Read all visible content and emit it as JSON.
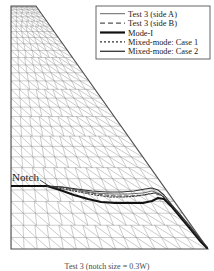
{
  "figure": {
    "name": "fem-mesh-crack-trajectory",
    "caption": "Test 3 (notch size = 0.3W)",
    "notch_label": "Notch"
  },
  "legend": {
    "box": {
      "x": 96,
      "y": 6,
      "width": 114,
      "height": 53,
      "border_color": "#555555",
      "fill": "#ffffff"
    },
    "entries": [
      {
        "label": "Test 3 (side A)",
        "style": "thin-solid",
        "color": "#555555",
        "width": 0.9,
        "dash": ""
      },
      {
        "label": "Test 3 (side B)",
        "style": "dashed",
        "color": "#555555",
        "width": 1.1,
        "dash": "5,3"
      },
      {
        "label": "Mode-I",
        "style": "thick-solid",
        "color": "#111111",
        "width": 2.2,
        "dash": ""
      },
      {
        "label": "Mixed-mode: Case 1",
        "style": "dotted",
        "color": "#333333",
        "width": 1.1,
        "dash": "2,2"
      },
      {
        "label": "Mixed-mode: Case 2",
        "style": "solid",
        "color": "#333333",
        "width": 1.3,
        "dash": ""
      }
    ]
  },
  "mesh": {
    "outline_color": "#4f4f4f",
    "line_color": "#8d8d8d",
    "left": 11,
    "top": 6,
    "right": 208,
    "bottom": 250,
    "apex_x": 36,
    "description": "triangular finite element mesh, wedge shaped domain"
  },
  "chart_data": {
    "type": "line",
    "title": "Test 3 (notch size = 0.3W)",
    "xlabel": "",
    "ylabel": "",
    "grid": false,
    "legend_position": "top-right",
    "notch_line": {
      "name": "Notch",
      "points": [
        [
          11,
          186
        ],
        [
          47,
          186
        ]
      ]
    },
    "series": [
      {
        "name": "Test 3 (side A)",
        "style": "thin-solid",
        "color": "#555555",
        "points": [
          [
            47,
            186
          ],
          [
            62,
            187
          ],
          [
            78,
            190
          ],
          [
            95,
            193
          ],
          [
            112,
            194
          ],
          [
            128,
            194
          ],
          [
            143,
            193
          ],
          [
            152,
            191
          ],
          [
            160,
            194
          ],
          [
            170,
            203
          ],
          [
            180,
            214
          ],
          [
            190,
            226
          ],
          [
            200,
            238
          ],
          [
            207,
            247
          ]
        ]
      },
      {
        "name": "Test 3 (side B)",
        "style": "dashed",
        "color": "#555555",
        "points": [
          [
            47,
            186
          ],
          [
            63,
            188
          ],
          [
            80,
            191
          ],
          [
            97,
            194
          ],
          [
            114,
            196
          ],
          [
            130,
            196
          ],
          [
            145,
            195
          ],
          [
            154,
            193
          ],
          [
            162,
            196
          ],
          [
            172,
            206
          ],
          [
            182,
            217
          ],
          [
            192,
            229
          ],
          [
            201,
            240
          ],
          [
            207,
            247
          ]
        ]
      },
      {
        "name": "Mode-I",
        "style": "thick-solid",
        "color": "#111111",
        "points": [
          [
            47,
            186
          ],
          [
            60,
            190
          ],
          [
            74,
            195
          ],
          [
            88,
            199
          ],
          [
            101,
            202
          ],
          [
            115,
            203
          ],
          [
            130,
            203
          ],
          [
            143,
            203
          ],
          [
            152,
            201
          ],
          [
            158,
            198
          ],
          [
            164,
            199
          ],
          [
            172,
            207
          ],
          [
            182,
            219
          ],
          [
            192,
            231
          ],
          [
            201,
            242
          ],
          [
            207,
            248
          ]
        ]
      },
      {
        "name": "Mixed-mode: Case 1",
        "style": "dotted",
        "color": "#333333",
        "points": [
          [
            47,
            186
          ],
          [
            63,
            189
          ],
          [
            79,
            192
          ],
          [
            95,
            195
          ],
          [
            110,
            197
          ],
          [
            125,
            197
          ],
          [
            138,
            196
          ],
          [
            148,
            194
          ],
          [
            156,
            193
          ],
          [
            163,
            196
          ],
          [
            171,
            205
          ],
          [
            181,
            217
          ],
          [
            191,
            229
          ],
          [
            200,
            240
          ],
          [
            207,
            247
          ]
        ]
      },
      {
        "name": "Mixed-mode: Case 2",
        "style": "solid",
        "color": "#333333",
        "points": [
          [
            47,
            186
          ],
          [
            62,
            187
          ],
          [
            77,
            189
          ],
          [
            92,
            191
          ],
          [
            107,
            192
          ],
          [
            121,
            192
          ],
          [
            134,
            191
          ],
          [
            145,
            189
          ],
          [
            152,
            188
          ],
          [
            158,
            190
          ],
          [
            164,
            195
          ],
          [
            172,
            205
          ],
          [
            182,
            217
          ],
          [
            192,
            229
          ],
          [
            201,
            240
          ],
          [
            207,
            247
          ]
        ]
      }
    ]
  }
}
